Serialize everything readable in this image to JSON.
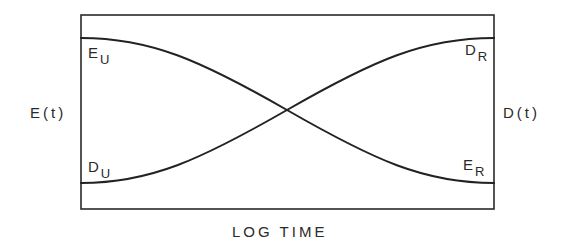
{
  "figure": {
    "width": 573,
    "height": 247,
    "frame": {
      "x": 81,
      "y": 15,
      "width": 413,
      "height": 194
    },
    "line_color": "#222222",
    "background": "#ffffff"
  },
  "axes": {
    "x_label": "LOG TIME",
    "y_left_label": "E(t)",
    "y_right_label": "D(t)"
  },
  "curves": [
    {
      "name": "E(t)",
      "description": "decreasing sigmoid from unrelaxed to relaxed value",
      "start_label": {
        "main": "E",
        "sub": "U"
      },
      "end_label": {
        "main": "E",
        "sub": "R"
      },
      "start_y": 38,
      "end_y": 183,
      "path": "M81,38 C150,38 200,60 287,110 C374,160 424,183 494,183"
    },
    {
      "name": "D(t)",
      "description": "increasing sigmoid from unrelaxed to relaxed value",
      "start_label": {
        "main": "D",
        "sub": "U"
      },
      "end_label": {
        "main": "D",
        "sub": "R"
      },
      "start_y": 183,
      "end_y": 38,
      "path": "M81,183 C150,183 200,160 287,110 C374,60 424,38 494,38"
    }
  ],
  "crossing_point": {
    "x": 287,
    "y": 110
  },
  "labels": {
    "E_U": {
      "main": "E",
      "sub": "U"
    },
    "D_U": {
      "main": "D",
      "sub": "U"
    },
    "D_R": {
      "main": "D",
      "sub": "R"
    },
    "E_R": {
      "main": "E",
      "sub": "R"
    }
  }
}
